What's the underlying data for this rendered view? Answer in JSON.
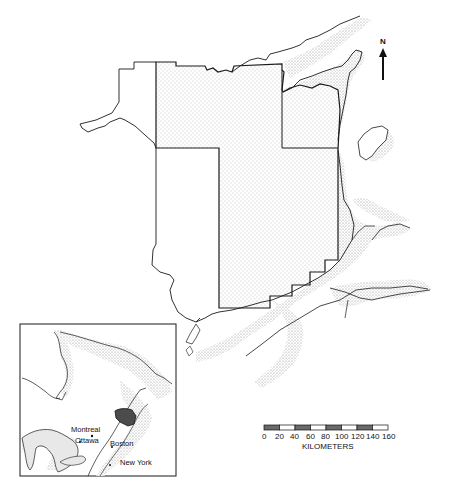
{
  "map": {
    "north_label": "N",
    "colors": {
      "line": "#1a1a1a",
      "stipple": "#9a9a9a",
      "land": "#ffffff",
      "scale_dark": "#6a6a6a"
    }
  },
  "inset": {
    "labels": {
      "montreal": "Montreal",
      "ottawa": "Ottawa",
      "boston": "Boston",
      "new_york": "New York"
    }
  },
  "scale_bar": {
    "unit_label": "KILOMETERS",
    "ticks": [
      "0",
      "20",
      "40",
      "60",
      "80",
      "100",
      "120",
      "140",
      "160"
    ]
  }
}
